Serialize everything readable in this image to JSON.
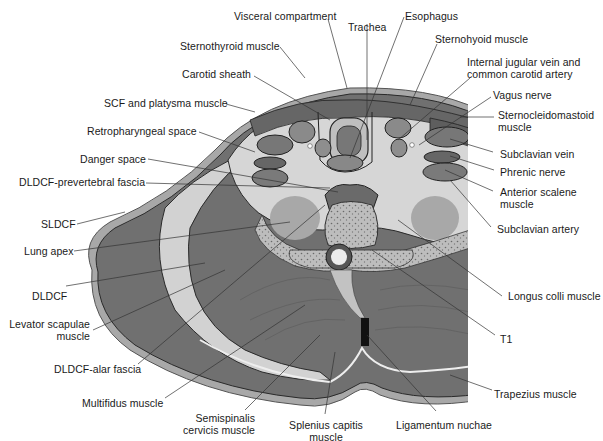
{
  "figure": {
    "colors": {
      "background": "#ffffff",
      "muscle": "#6e6e6e",
      "muscle_dark": "#5a5a5a",
      "fascia_light": "#d4d4d4",
      "skin": "#a8a8a8",
      "bone": "#b8b8b8",
      "lung": "#a0a0a0",
      "ligament": "#111111",
      "leader_line": "#333333",
      "text": "#1a1a1a"
    }
  },
  "labels": {
    "visceral_compartment": "Visceral compartment",
    "trachea": "Trachea",
    "esophagus": "Esophagus",
    "sternothyroid": "Sternothyroid muscle",
    "sternohyoid": "Sternohyoid muscle",
    "carotid_sheath": "Carotid sheath",
    "ijv_cca": "Internal jugular vein and\ncommon carotid artery",
    "scf_platysma": "SCF and platysma muscle",
    "vagus": "Vagus nerve",
    "scm": "Sternocleidomastoid\nmuscle",
    "retropharyngeal": "Retropharyngeal space",
    "danger_space": "Danger space",
    "subclavian_vein": "Subclavian vein",
    "dldcf_prevertebral": "DLDCF-prevertebral fascia",
    "phrenic": "Phrenic nerve",
    "anterior_scalene": "Anterior scalene\nmuscle",
    "sldcf": "SLDCF",
    "subclavian_artery": "Subclavian artery",
    "lung_apex": "Lung apex",
    "dldcf": "DLDCF",
    "longus_colli": "Longus colli muscle",
    "levator_scapulae": "Levator scapulae\nmuscle",
    "t1": "T1",
    "dldcf_alar": "DLDCF-alar fascia",
    "trapezius": "Trapezius muscle",
    "multifidus": "Multifidus muscle",
    "semispinalis": "Semispinalis\ncervicis muscle",
    "splenius": "Splenius capitis\nmuscle",
    "ligamentum_nuchae": "Ligamentum nuchae"
  }
}
